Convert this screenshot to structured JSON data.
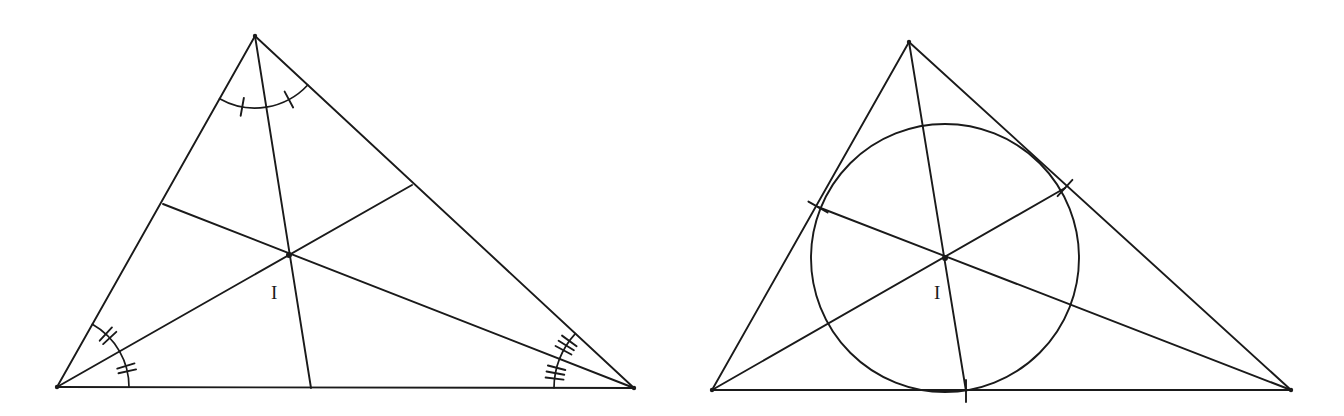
{
  "figure": {
    "background_color": "#ffffff",
    "stroke_color": "#1a1a1a",
    "width": 1344,
    "height": 416,
    "panels": [
      {
        "id": "left-panel",
        "name": "angle-bisectors-concurrency",
        "incenter_label": "I",
        "incenter_label_x": 271,
        "incenter_label_y": 299,
        "incenter": {
          "x": 289,
          "y": 255
        },
        "triangle": {
          "apex": {
            "x": 255,
            "y": 36
          },
          "bottom_left": {
            "x": 57,
            "y": 387
          },
          "bottom_right": {
            "x": 634,
            "y": 388
          }
        },
        "bisector_feet": {
          "from_apex_on_base": {
            "x": 311,
            "y": 388
          },
          "from_bottom_left_on_right": {
            "x": 412,
            "y": 185
          },
          "from_bottom_right_on_left": {
            "x": 163,
            "y": 204
          }
        },
        "angle_marks": [
          {
            "vertex": "apex",
            "arcs": 2,
            "ticks_per_arc": 1,
            "arc_radius": 72
          },
          {
            "vertex": "bottom_left",
            "arcs": 2,
            "ticks_per_arc": 2,
            "arc_radius": 72
          },
          {
            "vertex": "bottom_right",
            "arcs": 2,
            "ticks_per_arc": 3,
            "arc_radius": 80
          }
        ]
      },
      {
        "id": "right-panel",
        "name": "incircle-and-incenter",
        "incenter_label": "I",
        "incenter_label_x": 934,
        "incenter_label_y": 299,
        "incenter": {
          "x": 945,
          "y": 258
        },
        "incircle": {
          "cx": 945,
          "cy": 258,
          "r": 134
        },
        "triangle": {
          "apex": {
            "x": 909,
            "y": 42
          },
          "bottom_left": {
            "x": 712,
            "y": 390
          },
          "bottom_right": {
            "x": 1291,
            "y": 390
          }
        },
        "bisector_feet": {
          "from_apex_on_base": {
            "x": 966,
            "y": 391
          },
          "from_bottom_left_on_right": {
            "x": 1065,
            "y": 188
          },
          "from_bottom_right_on_left": {
            "x": 818,
            "y": 207
          }
        },
        "tangent_ticks": [
          {
            "side": "base",
            "point": {
              "x": 966,
              "y": 391
            },
            "ticks": 1
          },
          {
            "side": "left-side",
            "point": {
              "x": 818,
              "y": 207
            },
            "ticks": 1
          },
          {
            "side": "right-side",
            "point": {
              "x": 1065,
              "y": 188
            },
            "ticks": 1
          }
        ]
      }
    ]
  }
}
